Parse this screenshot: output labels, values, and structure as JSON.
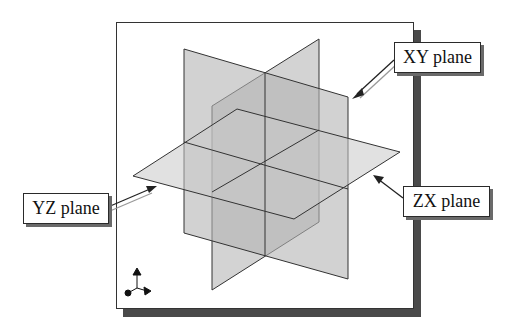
{
  "figure": {
    "labels": {
      "xy": "XY plane",
      "yz": "YZ plane",
      "zx": "ZX plane"
    },
    "icons": {
      "triad": "coordinate-triad-icon"
    },
    "colors": {
      "plane_fill": "#b8b8b8",
      "plane_edge": "#333333",
      "frame_shadow": "#4a4a4a",
      "background": "#ffffff"
    }
  }
}
